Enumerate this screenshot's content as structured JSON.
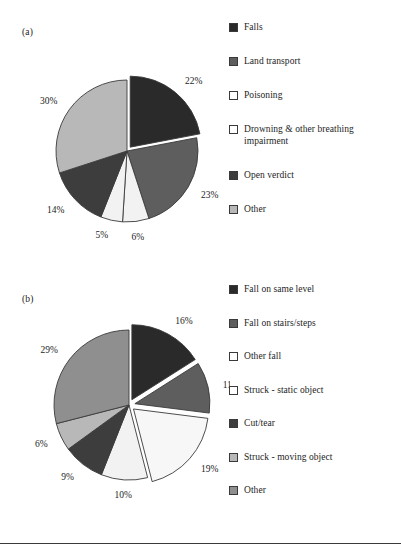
{
  "figure": {
    "panels": [
      {
        "id": "a",
        "label": "(a)",
        "legend_title": "",
        "chart_ref": 0
      },
      {
        "id": "b",
        "label": "(b)",
        "legend_title": "",
        "chart_ref": 1
      }
    ],
    "rule_color": "#3a3a3a"
  },
  "palette": {
    "very_dark": "#2a2a2a",
    "dark": "#3d3d3d",
    "medium": "#5e5e5e",
    "mid_gray": "#8f8f8f",
    "light": "#b8b8b8",
    "very_light": "#f2f2f2",
    "white": "#ffffff",
    "outline": "#3a3a3a"
  },
  "chart_data": [
    {
      "type": "pie",
      "title": "(a)",
      "panel": "a",
      "categories": [
        "Falls",
        "Land transport",
        "Poisoning",
        "Drowning & other breathing impairment",
        "Open verdict",
        "Other"
      ],
      "values": [
        22,
        23,
        6,
        5,
        14,
        30
      ],
      "value_labels": [
        "22%",
        "23%",
        "6%",
        "5%",
        "14%",
        "30%"
      ],
      "colors": [
        "#2a2a2a",
        "#5e5e5e",
        "#f2f2f2",
        "#f2f2f2",
        "#3d3d3d",
        "#b8b8b8"
      ],
      "exploded": [
        true,
        false,
        false,
        false,
        false,
        false
      ],
      "legend_position": "right",
      "start_angle_deg": 0,
      "direction": "clockwise",
      "legend": [
        {
          "label": "Falls",
          "color": "#2a2a2a"
        },
        {
          "label": "Land transport",
          "color": "#5e5e5e"
        },
        {
          "label": "Poisoning",
          "color": "#ffffff"
        },
        {
          "label": "Drowning & other breathing\nimpairment",
          "color": "#ffffff"
        },
        {
          "label": "Open verdict",
          "color": "#3d3d3d"
        },
        {
          "label": "Other",
          "color": "#b8b8b8"
        }
      ]
    },
    {
      "type": "pie",
      "title": "(b)",
      "panel": "b",
      "categories": [
        "Fall on same level",
        "Fall on stairs/steps",
        "Other fall",
        "Struck - static object",
        "Cut/tear",
        "Struck - moving object",
        "Other"
      ],
      "values": [
        16,
        11,
        19,
        10,
        9,
        6,
        29
      ],
      "value_labels": [
        "16%",
        "11%",
        "19%",
        "10%",
        "9%",
        "6%",
        "29%"
      ],
      "colors": [
        "#2a2a2a",
        "#5e5e5e",
        "#f7f7f7",
        "#f2f2f2",
        "#3d3d3d",
        "#b8b8b8",
        "#8f8f8f"
      ],
      "exploded": [
        true,
        true,
        true,
        false,
        false,
        false,
        false
      ],
      "legend_position": "right",
      "start_angle_deg": 0,
      "direction": "clockwise",
      "legend": [
        {
          "label": "Fall on same level",
          "color": "#2a2a2a"
        },
        {
          "label": "Fall on stairs/steps",
          "color": "#5e5e5e"
        },
        {
          "label": "Other fall",
          "color": "#ffffff"
        },
        {
          "label": "Struck - static object",
          "color": "#ffffff"
        },
        {
          "label": "Cut/tear",
          "color": "#3d3d3d"
        },
        {
          "label": "Struck - moving object",
          "color": "#b8b8b8"
        },
        {
          "label": "Other",
          "color": "#8f8f8f"
        }
      ]
    }
  ]
}
